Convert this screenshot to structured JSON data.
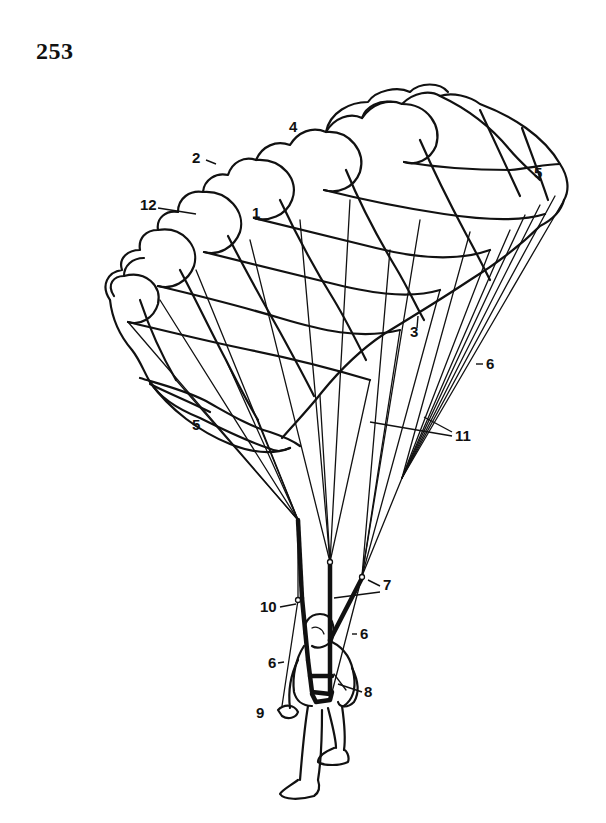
{
  "page": {
    "number": "253"
  },
  "diagram": {
    "labels": [
      {
        "id": "1",
        "text": "1",
        "x": 255,
        "y": 218
      },
      {
        "id": "2",
        "text": "2",
        "x": 194,
        "y": 163
      },
      {
        "id": "3",
        "text": "3",
        "x": 410,
        "y": 337
      },
      {
        "id": "4",
        "text": "4",
        "x": 291,
        "y": 131
      },
      {
        "id": "5a",
        "text": "5",
        "x": 535,
        "y": 177
      },
      {
        "id": "5b",
        "text": "5",
        "x": 194,
        "y": 430
      },
      {
        "id": "6a",
        "text": "6",
        "x": 487,
        "y": 368
      },
      {
        "id": "6b",
        "text": "6",
        "x": 360,
        "y": 638
      },
      {
        "id": "6c",
        "text": "6",
        "x": 271,
        "y": 667
      },
      {
        "id": "7",
        "text": "7",
        "x": 383,
        "y": 589
      },
      {
        "id": "8",
        "text": "8",
        "x": 364,
        "y": 697
      },
      {
        "id": "9",
        "text": "9",
        "x": 258,
        "y": 717
      },
      {
        "id": "10",
        "text": "10",
        "x": 260,
        "y": 611
      },
      {
        "id": "11",
        "text": "11",
        "x": 455,
        "y": 440
      },
      {
        "id": "12",
        "text": "12",
        "x": 142,
        "y": 210
      }
    ]
  }
}
